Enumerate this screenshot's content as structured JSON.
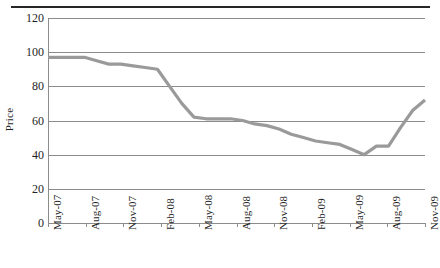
{
  "chart_data": {
    "type": "line",
    "title": "",
    "xlabel": "",
    "ylabel": "Price",
    "ylim": [
      0,
      120
    ],
    "ytick_values": [
      0,
      20,
      40,
      60,
      80,
      100,
      120
    ],
    "ytick_labels": [
      "0",
      "20",
      "40",
      "60",
      "80",
      "100",
      "120"
    ],
    "grid": "horizontal",
    "legend": "none",
    "categories": [
      "May-07",
      "Aug-07",
      "Nov-07",
      "Feb-08",
      "May-08",
      "Aug-08",
      "Nov-08",
      "Feb-09",
      "May-09",
      "Aug-09",
      "Nov-09"
    ],
    "series": [
      {
        "name": "Price",
        "color": "#9a9a9a",
        "values": [
          97,
          97,
          93,
          90,
          62,
          61,
          57,
          50,
          40,
          45,
          72
        ]
      }
    ],
    "points": [
      {
        "x": "May-07",
        "y": 97
      },
      {
        "x": "Jun-07",
        "y": 97
      },
      {
        "x": "Jul-07",
        "y": 97
      },
      {
        "x": "Aug-07",
        "y": 97
      },
      {
        "x": "Sep-07",
        "y": 95
      },
      {
        "x": "Oct-07",
        "y": 93
      },
      {
        "x": "Nov-07",
        "y": 93
      },
      {
        "x": "Dec-07",
        "y": 92
      },
      {
        "x": "Jan-08",
        "y": 91
      },
      {
        "x": "Feb-08",
        "y": 90
      },
      {
        "x": "Mar-08",
        "y": 80
      },
      {
        "x": "Apr-08",
        "y": 70
      },
      {
        "x": "May-08",
        "y": 62
      },
      {
        "x": "Jun-08",
        "y": 61
      },
      {
        "x": "Jul-08",
        "y": 61
      },
      {
        "x": "Aug-08",
        "y": 61
      },
      {
        "x": "Sep-08",
        "y": 60
      },
      {
        "x": "Oct-08",
        "y": 58
      },
      {
        "x": "Nov-08",
        "y": 57
      },
      {
        "x": "Dec-08",
        "y": 55
      },
      {
        "x": "Jan-09",
        "y": 52
      },
      {
        "x": "Feb-09",
        "y": 50
      },
      {
        "x": "Mar-09",
        "y": 48
      },
      {
        "x": "Apr-09",
        "y": 47
      },
      {
        "x": "May-09",
        "y": 46
      },
      {
        "x": "Jun-09",
        "y": 43
      },
      {
        "x": "Jul-09",
        "y": 40
      },
      {
        "x": "Aug-09",
        "y": 45
      },
      {
        "x": "Sep-09",
        "y": 45
      },
      {
        "x": "Oct-09",
        "y": 56
      },
      {
        "x": "Nov-09",
        "y": 66
      },
      {
        "x": "Dec-09",
        "y": 72
      }
    ],
    "annotations": [],
    "colors": {
      "line": "#9a9a9a",
      "grid": "#8c8c8c",
      "axis": "#8c8c8c",
      "text": "#1f1f1f",
      "top_rule": "#262626",
      "background": "#ffffff"
    }
  }
}
